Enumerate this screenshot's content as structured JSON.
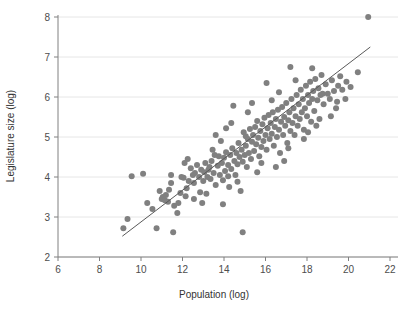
{
  "chart_data": {
    "type": "scatter",
    "title": "",
    "xlabel": "Population (log)",
    "ylabel": "Legislature size (log)",
    "xlim": [
      6,
      22
    ],
    "ylim": [
      2,
      8
    ],
    "xticks": [
      6,
      8,
      10,
      12,
      14,
      16,
      18,
      20,
      22
    ],
    "yticks": [
      2,
      3,
      4,
      5,
      6,
      7,
      8
    ],
    "xtick_labels": [
      "6",
      "8",
      "10",
      "12",
      "14",
      "16",
      "18",
      "20",
      "22"
    ],
    "ytick_labels": [
      "2",
      "3",
      "4",
      "5",
      "6",
      "7",
      "8"
    ],
    "grid": "horizontal",
    "legend": "none",
    "point_color": "#808080",
    "point_radius": 3,
    "line_color": "#595959",
    "grid_color": "#e6e6e6",
    "axis_color": "#808080",
    "trendline": {
      "type": "linear-fit",
      "x_start": 9.1,
      "y_start": 2.52,
      "x_end": 21.05,
      "y_end": 7.25
    },
    "points": [
      [
        9.15,
        2.72
      ],
      [
        9.35,
        2.95
      ],
      [
        9.55,
        4.02
      ],
      [
        10.1,
        4.08
      ],
      [
        10.3,
        3.35
      ],
      [
        10.55,
        3.2
      ],
      [
        10.75,
        2.72
      ],
      [
        11.0,
        3.45
      ],
      [
        11.05,
        3.5
      ],
      [
        11.15,
        3.42
      ],
      [
        11.2,
        3.55
      ],
      [
        11.3,
        3.38
      ],
      [
        11.35,
        3.68
      ],
      [
        11.45,
        3.85
      ],
      [
        11.55,
        2.62
      ],
      [
        11.6,
        3.28
      ],
      [
        11.75,
        3.1
      ],
      [
        11.8,
        3.35
      ],
      [
        11.95,
        4.0
      ],
      [
        12.05,
        3.98
      ],
      [
        12.1,
        4.35
      ],
      [
        12.2,
        3.72
      ],
      [
        12.3,
        3.9
      ],
      [
        12.4,
        4.22
      ],
      [
        12.5,
        4.05
      ],
      [
        12.55,
        3.85
      ],
      [
        12.6,
        4.1
      ],
      [
        12.7,
        4.3
      ],
      [
        12.8,
        4.0
      ],
      [
        12.85,
        3.62
      ],
      [
        12.9,
        4.18
      ],
      [
        13.0,
        3.9
      ],
      [
        13.05,
        4.12
      ],
      [
        13.1,
        4.35
      ],
      [
        13.15,
        3.58
      ],
      [
        13.2,
        4.0
      ],
      [
        13.3,
        4.25
      ],
      [
        13.35,
        3.95
      ],
      [
        13.4,
        4.4
      ],
      [
        13.5,
        4.1
      ],
      [
        13.55,
        4.55
      ],
      [
        13.6,
        3.8
      ],
      [
        13.7,
        4.28
      ],
      [
        13.75,
        4.52
      ],
      [
        13.8,
        4.05
      ],
      [
        13.9,
        4.35
      ],
      [
        13.95,
        3.92
      ],
      [
        14.0,
        4.48
      ],
      [
        14.05,
        4.15
      ],
      [
        14.1,
        4.62
      ],
      [
        14.2,
        4.3
      ],
      [
        14.25,
        3.75
      ],
      [
        14.3,
        4.55
      ],
      [
        14.35,
        4.2
      ],
      [
        14.4,
        4.72
      ],
      [
        14.5,
        4.4
      ],
      [
        14.55,
        4.05
      ],
      [
        14.6,
        4.6
      ],
      [
        14.65,
        4.32
      ],
      [
        14.7,
        4.85
      ],
      [
        14.75,
        4.5
      ],
      [
        14.8,
        3.65
      ],
      [
        14.85,
        4.68
      ],
      [
        14.9,
        4.38
      ],
      [
        14.95,
        5.12
      ],
      [
        15.0,
        4.55
      ],
      [
        15.05,
        4.78
      ],
      [
        15.1,
        4.25
      ],
      [
        15.15,
        4.95
      ],
      [
        15.2,
        4.6
      ],
      [
        15.25,
        5.2
      ],
      [
        15.3,
        4.45
      ],
      [
        15.35,
        4.88
      ],
      [
        15.4,
        5.05
      ],
      [
        15.45,
        4.65
      ],
      [
        15.5,
        5.25
      ],
      [
        15.55,
        4.82
      ],
      [
        15.6,
        5.4
      ],
      [
        15.65,
        4.98
      ],
      [
        15.7,
        4.52
      ],
      [
        15.75,
        5.15
      ],
      [
        15.8,
        4.75
      ],
      [
        15.85,
        5.32
      ],
      [
        15.9,
        4.9
      ],
      [
        15.95,
        5.48
      ],
      [
        16.0,
        5.05
      ],
      [
        16.05,
        4.68
      ],
      [
        16.1,
        5.22
      ],
      [
        16.15,
        5.55
      ],
      [
        16.2,
        4.95
      ],
      [
        16.25,
        5.35
      ],
      [
        16.3,
        5.08
      ],
      [
        16.35,
        5.62
      ],
      [
        16.4,
        4.78
      ],
      [
        16.45,
        5.25
      ],
      [
        16.5,
        5.45
      ],
      [
        16.55,
        5.0
      ],
      [
        16.6,
        5.68
      ],
      [
        16.65,
        5.18
      ],
      [
        16.7,
        4.6
      ],
      [
        16.75,
        5.38
      ],
      [
        16.8,
        5.75
      ],
      [
        16.85,
        5.05
      ],
      [
        16.9,
        5.5
      ],
      [
        16.95,
        5.28
      ],
      [
        17.0,
        5.85
      ],
      [
        17.05,
        4.85
      ],
      [
        17.1,
        5.42
      ],
      [
        17.15,
        5.62
      ],
      [
        17.2,
        5.15
      ],
      [
        17.25,
        5.95
      ],
      [
        17.3,
        5.35
      ],
      [
        17.35,
        5.72
      ],
      [
        17.4,
        5.05
      ],
      [
        17.45,
        5.52
      ],
      [
        17.5,
        6.05
      ],
      [
        17.55,
        5.28
      ],
      [
        17.6,
        5.82
      ],
      [
        17.65,
        5.45
      ],
      [
        17.7,
        6.18
      ],
      [
        17.75,
        5.62
      ],
      [
        17.8,
        5.95
      ],
      [
        17.85,
        5.18
      ],
      [
        17.9,
        5.72
      ],
      [
        17.95,
        6.28
      ],
      [
        18.0,
        5.52
      ],
      [
        18.05,
        6.05
      ],
      [
        18.1,
        5.85
      ],
      [
        18.15,
        6.38
      ],
      [
        18.2,
        5.38
      ],
      [
        18.25,
        5.95
      ],
      [
        18.3,
        6.15
      ],
      [
        18.35,
        5.65
      ],
      [
        18.4,
        6.45
      ],
      [
        18.5,
        5.92
      ],
      [
        18.55,
        6.22
      ],
      [
        18.6,
        5.45
      ],
      [
        18.65,
        6.05
      ],
      [
        18.7,
        6.55
      ],
      [
        18.8,
        5.82
      ],
      [
        18.9,
        6.32
      ],
      [
        19.0,
        6.08
      ],
      [
        19.1,
        5.95
      ],
      [
        19.2,
        6.42
      ],
      [
        19.3,
        6.15
      ],
      [
        19.4,
        5.72
      ],
      [
        19.5,
        6.28
      ],
      [
        19.6,
        6.52
      ],
      [
        19.7,
        6.18
      ],
      [
        19.9,
        6.38
      ],
      [
        20.1,
        6.25
      ],
      [
        20.45,
        6.62
      ],
      [
        15.05,
        5.02
      ],
      [
        13.25,
        4.18
      ],
      [
        12.15,
        3.52
      ],
      [
        17.2,
        6.75
      ],
      [
        16.05,
        6.35
      ],
      [
        14.45,
        5.78
      ],
      [
        18.25,
        6.72
      ],
      [
        19.85,
        5.95
      ],
      [
        20.95,
        8.0
      ],
      [
        14.9,
        2.62
      ],
      [
        13.95,
        3.32
      ],
      [
        12.95,
        3.35
      ],
      [
        11.45,
        4.05
      ],
      [
        16.5,
        4.25
      ],
      [
        15.6,
        4.12
      ],
      [
        17.85,
        4.95
      ],
      [
        14.1,
        5.22
      ],
      [
        15.35,
        5.85
      ],
      [
        16.9,
        4.4
      ],
      [
        13.45,
        4.68
      ],
      [
        18.45,
        5.28
      ],
      [
        19.15,
        5.52
      ],
      [
        12.55,
        3.45
      ],
      [
        13.85,
        4.9
      ],
      [
        14.65,
        3.88
      ],
      [
        15.8,
        4.35
      ],
      [
        16.65,
        6.12
      ],
      [
        17.45,
        6.42
      ],
      [
        18.75,
        6.08
      ],
      [
        11.9,
        3.6
      ],
      [
        10.9,
        3.65
      ],
      [
        12.25,
        4.45
      ],
      [
        13.6,
        5.05
      ],
      [
        14.35,
        5.35
      ],
      [
        15.15,
        5.62
      ],
      [
        16.3,
        5.92
      ],
      [
        17.1,
        4.72
      ],
      [
        18.05,
        5.12
      ],
      [
        19.45,
        5.88
      ],
      [
        14.2,
        4.02
      ]
    ]
  }
}
